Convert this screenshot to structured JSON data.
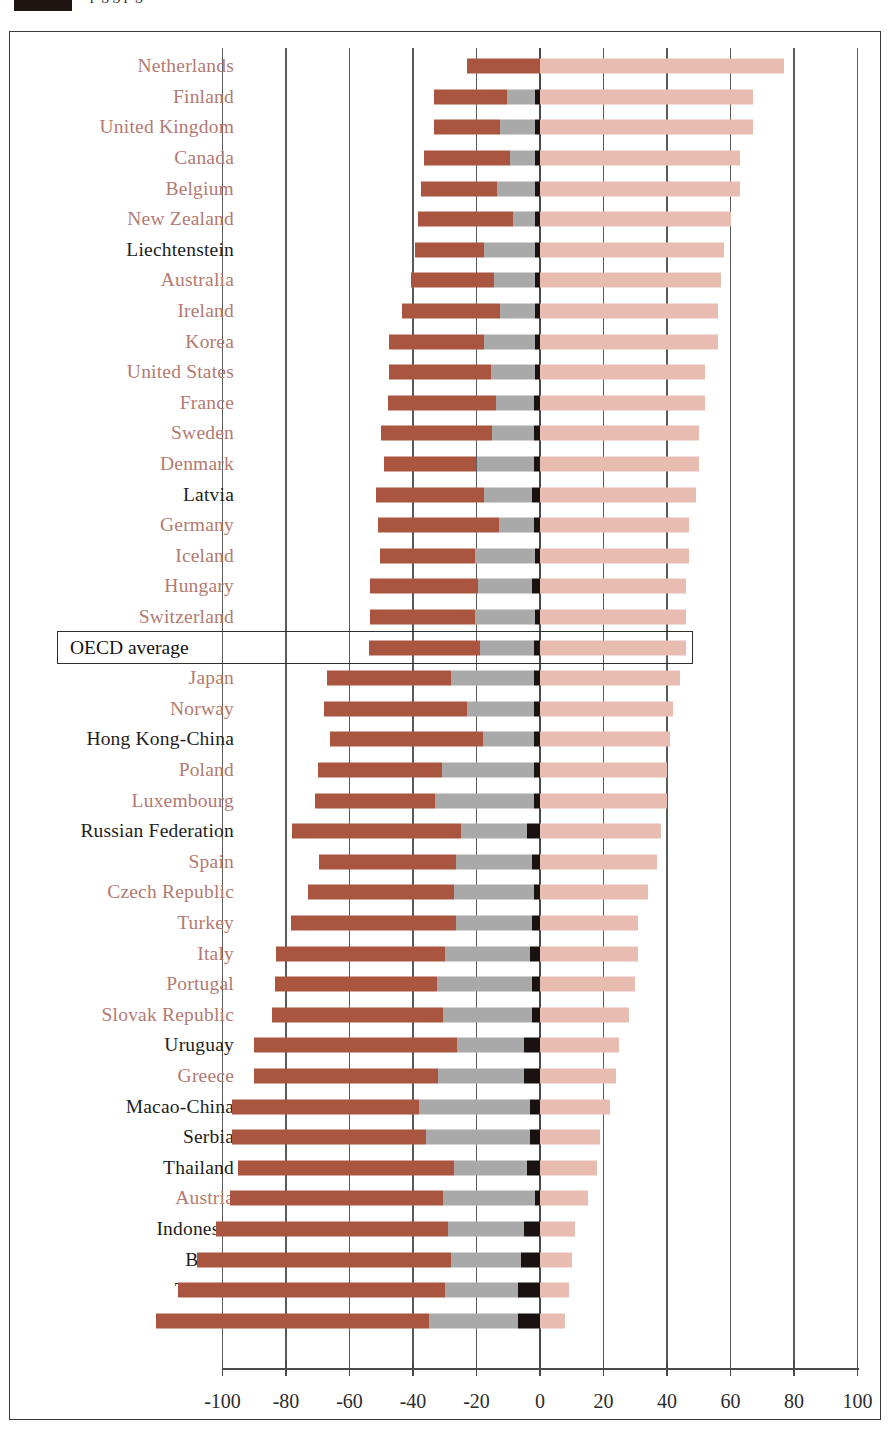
{
  "header": {
    "clipped_line": "p g g p g",
    "swatch_color": "#201512"
  },
  "colors": {
    "dark_red": "#a9553f",
    "gray": "#a9a9a9",
    "black": "#1a1210",
    "light_pink": "#e8bcb1",
    "oecd_label": "#b37a72",
    "partner_label": "#1d1d1d",
    "axis": "#4a4a4a"
  },
  "chart_data": {
    "type": "bar",
    "orientation": "horizontal",
    "stacked": true,
    "title": "",
    "xlabel": "",
    "ylabel": "",
    "xlim": [
      -100,
      100
    ],
    "xticks": [
      -100,
      -80,
      -60,
      -40,
      -20,
      0,
      20,
      40,
      60,
      80,
      100
    ],
    "xticklabels": [
      "-100",
      "-80",
      "-60",
      "-40",
      "-20",
      "0",
      "20",
      "40",
      "60",
      "80",
      "100"
    ],
    "grid": true,
    "legend_position": "top-clipped",
    "series": [
      {
        "name": "segment-dark-red",
        "color": "#a9553f",
        "side": "negative",
        "order": 1
      },
      {
        "name": "segment-gray",
        "color": "#a9a9a9",
        "side": "negative",
        "order": 2
      },
      {
        "name": "segment-black",
        "color": "#1a1210",
        "side": "negative",
        "order": 3
      },
      {
        "name": "segment-light-pink",
        "color": "#e8bcb1",
        "side": "positive",
        "order": 4
      }
    ],
    "highlight_row": "OECD average",
    "rows": [
      {
        "label": "Netherlands",
        "group": "oecd-member",
        "dark_red": 23,
        "gray": 0,
        "black": 0,
        "pink": 77
      },
      {
        "label": "Finland",
        "group": "oecd-member",
        "dark_red": 23,
        "gray": 9,
        "black": 1.5,
        "pink": 67
      },
      {
        "label": "United Kingdom",
        "group": "oecd-member",
        "dark_red": 21,
        "gray": 11,
        "black": 1.5,
        "pink": 67
      },
      {
        "label": "Canada",
        "group": "oecd-member",
        "dark_red": 27,
        "gray": 8,
        "black": 1.5,
        "pink": 63
      },
      {
        "label": "Belgium",
        "group": "oecd-member",
        "dark_red": 24,
        "gray": 12,
        "black": 1.5,
        "pink": 63
      },
      {
        "label": "New Zealand",
        "group": "oecd-member",
        "dark_red": 30,
        "gray": 7,
        "black": 1.5,
        "pink": 60
      },
      {
        "label": "Liechtenstein",
        "group": "partner",
        "dark_red": 22,
        "gray": 16,
        "black": 1.5,
        "pink": 58
      },
      {
        "label": "Australia",
        "group": "oecd-member",
        "dark_red": 26,
        "gray": 13,
        "black": 1.5,
        "pink": 57
      },
      {
        "label": "Ireland",
        "group": "oecd-member",
        "dark_red": 31,
        "gray": 11,
        "black": 1.5,
        "pink": 56
      },
      {
        "label": "Korea",
        "group": "oecd-member",
        "dark_red": 30,
        "gray": 16,
        "black": 1.5,
        "pink": 56
      },
      {
        "label": "United States",
        "group": "oecd-member",
        "dark_red": 32,
        "gray": 14,
        "black": 1.5,
        "pink": 52
      },
      {
        "label": "France",
        "group": "oecd-member",
        "dark_red": 34,
        "gray": 12,
        "black": 2,
        "pink": 52
      },
      {
        "label": "Sweden",
        "group": "oecd-member",
        "dark_red": 35,
        "gray": 13,
        "black": 2,
        "pink": 50
      },
      {
        "label": "Denmark",
        "group": "oecd-member",
        "dark_red": 29,
        "gray": 18,
        "black": 2,
        "pink": 50
      },
      {
        "label": "Latvia",
        "group": "partner",
        "dark_red": 34,
        "gray": 15,
        "black": 2.5,
        "pink": 49
      },
      {
        "label": "Germany",
        "group": "oecd-member",
        "dark_red": 38,
        "gray": 11,
        "black": 2,
        "pink": 47
      },
      {
        "label": "Iceland",
        "group": "oecd-member",
        "dark_red": 30,
        "gray": 19,
        "black": 1.5,
        "pink": 47
      },
      {
        "label": "Hungary",
        "group": "oecd-member",
        "dark_red": 34,
        "gray": 17,
        "black": 2.5,
        "pink": 46
      },
      {
        "label": "Switzerland",
        "group": "oecd-member",
        "dark_red": 33,
        "gray": 19,
        "black": 1.5,
        "pink": 46
      },
      {
        "label": "OECD average",
        "group": "average",
        "dark_red": 35,
        "gray": 17,
        "black": 2,
        "pink": 46
      },
      {
        "label": "Japan",
        "group": "oecd-member",
        "dark_red": 39,
        "gray": 26,
        "black": 2,
        "pink": 44
      },
      {
        "label": "Norway",
        "group": "oecd-member",
        "dark_red": 45,
        "gray": 21,
        "black": 2,
        "pink": 42
      },
      {
        "label": "Hong Kong-China",
        "group": "partner",
        "dark_red": 48,
        "gray": 16,
        "black": 2,
        "pink": 41
      },
      {
        "label": "Poland",
        "group": "oecd-member",
        "dark_red": 39,
        "gray": 29,
        "black": 2,
        "pink": 40
      },
      {
        "label": "Luxembourg",
        "group": "oecd-member",
        "dark_red": 38,
        "gray": 31,
        "black": 2,
        "pink": 40
      },
      {
        "label": "Russian Federation",
        "group": "partner",
        "dark_red": 53,
        "gray": 21,
        "black": 4,
        "pink": 38
      },
      {
        "label": "Spain",
        "group": "oecd-member",
        "dark_red": 43,
        "gray": 24,
        "black": 2.5,
        "pink": 37
      },
      {
        "label": "Czech Republic",
        "group": "oecd-member",
        "dark_red": 46,
        "gray": 25,
        "black": 2,
        "pink": 34
      },
      {
        "label": "Turkey",
        "group": "oecd-member",
        "dark_red": 52,
        "gray": 24,
        "black": 2.5,
        "pink": 31
      },
      {
        "label": "Italy",
        "group": "oecd-member",
        "dark_red": 53,
        "gray": 27,
        "black": 3,
        "pink": 31
      },
      {
        "label": "Portugal",
        "group": "oecd-member",
        "dark_red": 51,
        "gray": 30,
        "black": 2.5,
        "pink": 30
      },
      {
        "label": "Slovak Republic",
        "group": "oecd-member",
        "dark_red": 54,
        "gray": 28,
        "black": 2.5,
        "pink": 28
      },
      {
        "label": "Uruguay",
        "group": "partner",
        "dark_red": 64,
        "gray": 21,
        "black": 5,
        "pink": 25
      },
      {
        "label": "Greece",
        "group": "oecd-member",
        "dark_red": 58,
        "gray": 27,
        "black": 5,
        "pink": 24
      },
      {
        "label": "Macao-China",
        "group": "partner",
        "dark_red": 59,
        "gray": 35,
        "black": 3,
        "pink": 22
      },
      {
        "label": "Serbia",
        "group": "partner",
        "dark_red": 61,
        "gray": 33,
        "black": 3,
        "pink": 19
      },
      {
        "label": "Thailand",
        "group": "partner",
        "dark_red": 68,
        "gray": 23,
        "black": 4,
        "pink": 18
      },
      {
        "label": "Austria",
        "group": "oecd-member",
        "dark_red": 67,
        "gray": 29,
        "black": 1.5,
        "pink": 15
      },
      {
        "label": "Indonesia",
        "group": "partner",
        "dark_red": 73,
        "gray": 24,
        "black": 5,
        "pink": 11
      },
      {
        "label": "Brazil",
        "group": "partner",
        "dark_red": 80,
        "gray": 22,
        "black": 6,
        "pink": 10
      },
      {
        "label": "Tunisia",
        "group": "partner",
        "dark_red": 84,
        "gray": 23,
        "black": 7,
        "pink": 9
      },
      {
        "label": "Mexico",
        "group": "partner",
        "dark_red": 86,
        "gray": 28,
        "black": 7,
        "pink": 8
      }
    ]
  }
}
